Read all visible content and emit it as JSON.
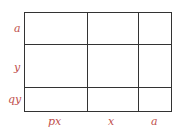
{
  "diagram": {
    "row_labels": [
      "a",
      "y",
      "qy"
    ],
    "col_labels": [
      "px",
      "x",
      "a"
    ],
    "label_color": "#c0504d",
    "line_color": "#333333"
  }
}
